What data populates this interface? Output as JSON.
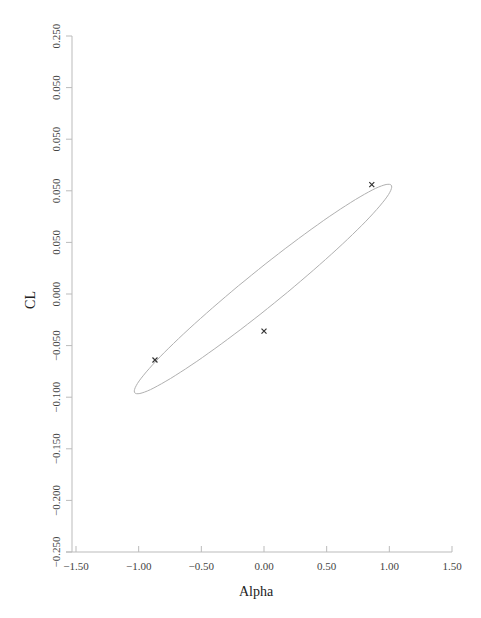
{
  "chart_data": {
    "type": "scatter",
    "title": "",
    "xlabel": "Alpha",
    "ylabel": "CL",
    "xlim": [
      -1.5,
      1.5
    ],
    "ylim": [
      -0.25,
      0.25
    ],
    "grid": false,
    "legend": null,
    "x_ticks": [
      "−1.50",
      "−1.00",
      "−0.50",
      "0.00",
      "0.50",
      "1.00",
      "1.50"
    ],
    "y_ticks": [
      "0.250",
      "0.050",
      "0.050",
      "0.050",
      "0.050",
      "0.000",
      "−0.050",
      "−0.100",
      "−0.150",
      "−0.200",
      "−0.250"
    ],
    "y_tick_values": [
      0.25,
      0.2,
      0.15,
      0.1,
      0.05,
      0.0,
      -0.05,
      -0.1,
      -0.15,
      -0.2,
      -0.25
    ],
    "series": [
      {
        "name": "points",
        "marker": "x",
        "color": "#333333",
        "points": [
          {
            "x": 0.86,
            "y": 0.106
          },
          {
            "x": -0.87,
            "y": -0.064
          },
          {
            "x": 0.0,
            "y": -0.036
          }
        ]
      }
    ],
    "annotations": [
      {
        "type": "ellipse",
        "color": "#aaaaaa",
        "center": {
          "x": 0.0,
          "y": 0.0
        },
        "x_extent": [
          -1.0,
          1.0
        ],
        "y_extent": [
          -0.1,
          0.107
        ],
        "orientation": "tilted, rising left-to-right"
      }
    ]
  }
}
